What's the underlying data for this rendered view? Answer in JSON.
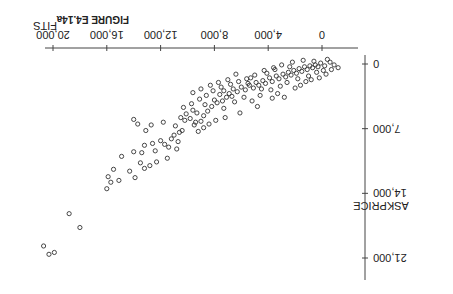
{
  "figure": {
    "label": "FIGURE E4.14a",
    "rotation_deg": 180
  },
  "chart_data": {
    "type": "scatter",
    "title": "FIGURE E4.14a",
    "xlabel": "FITS",
    "ylabel": "ASKPRICE",
    "xlim": [
      -1500,
      21500
    ],
    "ylim": [
      -1000,
      22500
    ],
    "xticks": [
      0,
      4000,
      8000,
      12000,
      16000,
      20000
    ],
    "xtick_labels": [
      "0",
      "4,000",
      "8,000",
      "12,000",
      "16,000",
      "20,000"
    ],
    "yticks": [
      0,
      7000,
      14000,
      21000
    ],
    "ytick_labels": [
      "0",
      "7,000",
      "14,000",
      "21,000"
    ],
    "grid": false,
    "marker": "open-circle",
    "points": [
      [
        20300,
        20600
      ],
      [
        19900,
        20400
      ],
      [
        20700,
        19700
      ],
      [
        18800,
        16200
      ],
      [
        18000,
        17700
      ],
      [
        16000,
        13500
      ],
      [
        15700,
        12800
      ],
      [
        15900,
        12200
      ],
      [
        15100,
        12600
      ],
      [
        15500,
        11400
      ],
      [
        13900,
        12300
      ],
      [
        14300,
        11600
      ],
      [
        13200,
        11300
      ],
      [
        12800,
        11000
      ],
      [
        13500,
        10700
      ],
      [
        14900,
        10000
      ],
      [
        14000,
        9500
      ],
      [
        13400,
        9600
      ],
      [
        12400,
        9400
      ],
      [
        13200,
        8800
      ],
      [
        12600,
        8600
      ],
      [
        12000,
        8300
      ],
      [
        11700,
        8700
      ],
      [
        11400,
        9000
      ],
      [
        10800,
        9200
      ],
      [
        11200,
        8100
      ],
      [
        11000,
        7700
      ],
      [
        10600,
        7400
      ],
      [
        10400,
        7200
      ],
      [
        10900,
        6700
      ],
      [
        11800,
        6300
      ],
      [
        12700,
        6600
      ],
      [
        13700,
        6500
      ],
      [
        14000,
        6000
      ],
      [
        13100,
        7200
      ],
      [
        9200,
        7300
      ],
      [
        8800,
        6900
      ],
      [
        9500,
        6600
      ],
      [
        9000,
        6200
      ],
      [
        9800,
        5900
      ],
      [
        10200,
        6100
      ],
      [
        10500,
        5800
      ],
      [
        10100,
        5400
      ],
      [
        9300,
        5300
      ],
      [
        9600,
        5000
      ],
      [
        8500,
        5100
      ],
      [
        8200,
        4600
      ],
      [
        8700,
        4400
      ],
      [
        7800,
        4200
      ],
      [
        8000,
        3900
      ],
      [
        7400,
        4000
      ],
      [
        7100,
        3600
      ],
      [
        7600,
        3300
      ],
      [
        6900,
        3200
      ],
      [
        7300,
        2900
      ],
      [
        6600,
        2700
      ],
      [
        6300,
        3000
      ],
      [
        6000,
        2500
      ],
      [
        5700,
        2800
      ],
      [
        5400,
        2300
      ],
      [
        5100,
        2600
      ],
      [
        4900,
        2000
      ],
      [
        4700,
        2300
      ],
      [
        4400,
        1800
      ],
      [
        4200,
        2100
      ],
      [
        3900,
        1500
      ],
      [
        3700,
        1900
      ],
      [
        3400,
        1300
      ],
      [
        3200,
        1600
      ],
      [
        2900,
        1100
      ],
      [
        2700,
        1400
      ],
      [
        2500,
        900
      ],
      [
        2300,
        1200
      ],
      [
        2100,
        700
      ],
      [
        1900,
        1000
      ],
      [
        1700,
        500
      ],
      [
        1500,
        800
      ],
      [
        1300,
        300
      ],
      [
        1100,
        600
      ],
      [
        900,
        200
      ],
      [
        700,
        400
      ],
      [
        500,
        100
      ],
      [
        300,
        300
      ],
      [
        100,
        -100
      ],
      [
        -200,
        200
      ],
      [
        -600,
        -200
      ],
      [
        -900,
        100
      ],
      [
        -1200,
        400
      ],
      [
        -400,
        -500
      ],
      [
        600,
        -300
      ],
      [
        1400,
        -400
      ],
      [
        2200,
        -200
      ],
      [
        3000,
        100
      ],
      [
        3600,
        400
      ],
      [
        4300,
        700
      ],
      [
        5000,
        1200
      ],
      [
        5600,
        1600
      ],
      [
        6200,
        1900
      ],
      [
        6800,
        2200
      ],
      [
        7500,
        2500
      ],
      [
        8100,
        2900
      ],
      [
        8600,
        3400
      ],
      [
        9100,
        3800
      ],
      [
        9700,
        4300
      ],
      [
        10300,
        4700
      ],
      [
        5800,
        3600
      ],
      [
        6500,
        4100
      ],
      [
        4600,
        3400
      ],
      [
        3800,
        2800
      ],
      [
        3100,
        2400
      ],
      [
        2600,
        2000
      ],
      [
        1800,
        1600
      ],
      [
        1000,
        1300
      ],
      [
        2000,
        2600
      ],
      [
        3300,
        3200
      ],
      [
        4800,
        4600
      ],
      [
        6100,
        5300
      ],
      [
        7200,
        5800
      ],
      [
        7900,
        6100
      ],
      [
        8400,
        6500
      ],
      [
        2400,
        300
      ],
      [
        3500,
        600
      ],
      [
        4100,
        1000
      ],
      [
        5300,
        1500
      ],
      [
        6400,
        1100
      ],
      [
        7000,
        1700
      ],
      [
        7700,
        2000
      ],
      [
        8300,
        2300
      ],
      [
        9000,
        2700
      ],
      [
        9600,
        3100
      ],
      [
        1200,
        1900
      ],
      [
        1600,
        2300
      ],
      [
        2800,
        3600
      ],
      [
        400,
        900
      ],
      [
        -100,
        700
      ],
      [
        -700,
        600
      ],
      [
        -300,
        1100
      ],
      [
        200,
        1500
      ],
      [
        800,
        1700
      ],
      [
        5200,
        4000
      ],
      [
        5500,
        2100
      ],
      [
        4500,
        2700
      ],
      [
        3700,
        3700
      ],
      [
        6700,
        3500
      ],
      [
        7300,
        4800
      ],
      [
        8800,
        5600
      ],
      [
        9400,
        6300
      ],
      [
        10700,
        8400
      ],
      [
        11500,
        10200
      ],
      [
        12300,
        10600
      ]
    ]
  }
}
